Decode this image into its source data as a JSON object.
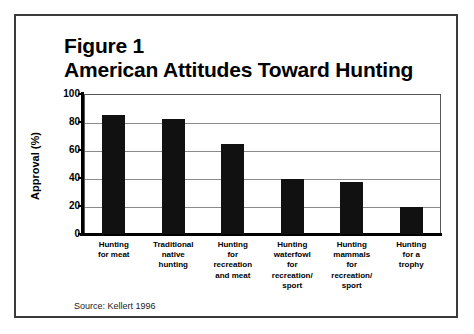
{
  "figure": {
    "title_line1": "Figure 1",
    "title_line2": "American Attitudes Toward Hunting",
    "source_note": "Source: Kellert 1996",
    "border_color": "#3a3a3a",
    "background": "#ffffff"
  },
  "chart_data": {
    "type": "bar",
    "xlabel": "",
    "ylabel": "Approval (%)",
    "ylim": [
      0,
      100
    ],
    "yticks": [
      0,
      20,
      40,
      60,
      80,
      100
    ],
    "ytick_labels": [
      "0",
      "20",
      "40",
      "60",
      "80",
      "100"
    ],
    "grid": true,
    "legend": false,
    "bar_color": "#111111",
    "categories": [
      "Hunting for meat",
      "Traditional native hunting",
      "Hunting for recreation and meat",
      "Hunting waterfowl for recreation/ sport",
      "Hunting mammals for recreation/ sport",
      "Hunting for a trophy"
    ],
    "category_lines": [
      [
        "Hunting",
        "for meat"
      ],
      [
        "Traditional",
        "native",
        "hunting"
      ],
      [
        "Hunting",
        "for",
        "recreation",
        "and meat"
      ],
      [
        "Hunting",
        "waterfowl",
        "for",
        "recreation/",
        "sport"
      ],
      [
        "Hunting",
        "mammals",
        "for",
        "recreation/",
        "sport"
      ],
      [
        "Hunting",
        "for a",
        "trophy"
      ]
    ],
    "values": [
      85,
      82,
      64,
      39,
      37,
      19
    ],
    "annotation": "Source: Kellert 1996"
  }
}
